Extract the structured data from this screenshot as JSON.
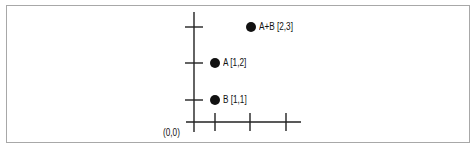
{
  "diagram": {
    "origin_label": "(0,0)",
    "points": [
      {
        "id": "B",
        "label": "B [1,1]",
        "x": 1,
        "y": 1
      },
      {
        "id": "A",
        "label": "A [1,2]",
        "x": 1,
        "y": 2
      },
      {
        "id": "A+B",
        "label": "A+B [2,3]",
        "x": 2,
        "y": 3
      }
    ],
    "x_ticks": 3,
    "y_ticks": 3,
    "colors": {
      "axis": "#222222",
      "point": "#111111",
      "frame": "#a8a8a8"
    }
  }
}
